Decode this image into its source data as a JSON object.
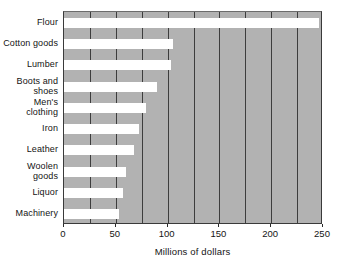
{
  "chart_data": {
    "type": "bar",
    "orientation": "horizontal",
    "title": "",
    "xlabel": "Millions of dollars",
    "ylabel": "",
    "xlim": [
      0,
      250
    ],
    "xticks": [
      0,
      50,
      100,
      150,
      200,
      250
    ],
    "xtick_labels": [
      "0",
      "50",
      "100",
      "150",
      "200",
      "250"
    ],
    "gridlines": {
      "visible": true,
      "axis": "x",
      "interval": 25,
      "values": [
        25,
        50,
        75,
        100,
        125,
        150,
        175,
        200,
        225
      ]
    },
    "legend": {
      "visible": false
    },
    "plot_background_color": "#b2b2b2",
    "bar_color": "#ffffff",
    "categories": [
      "Flour",
      "Cotton goods",
      "Lumber",
      "Boots and shoes",
      "Men's clothing",
      "Iron",
      "Leather",
      "Woolen goods",
      "Liquor",
      "Machinery"
    ],
    "values": [
      246,
      105,
      103,
      90,
      79,
      72,
      68,
      60,
      57,
      53
    ]
  },
  "axis": {
    "value_axis_title": "Millions of dollars",
    "tick_labels": [
      "0",
      "50",
      "100",
      "150",
      "200",
      "250"
    ]
  },
  "category_labels": [
    "Flour",
    "Cotton goods",
    "Lumber",
    "Boots and shoes",
    "Men's clothing",
    "Iron",
    "Leather",
    "Woolen goods",
    "Liquor",
    "Machinery"
  ]
}
